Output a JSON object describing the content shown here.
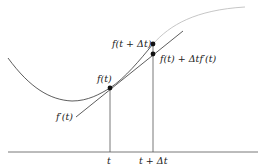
{
  "diagram": {
    "type": "tangent-line-approximation",
    "colors": {
      "curve": "#333333",
      "curve_light": "#b8b8b8",
      "tangent": "#333333",
      "axis": "#555555",
      "points": "#111111"
    },
    "labels": {
      "f_t": "f(t)",
      "f_t_plus_dt": "f(t + Δt)",
      "linear_approx": "f(t) + Δtf′(t)",
      "derivative": "f′(t)",
      "t": "t",
      "t_plus_dt": "t + Δt"
    }
  }
}
